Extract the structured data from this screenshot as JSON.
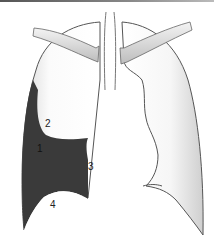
{
  "diagram": {
    "labels": [
      {
        "id": "1",
        "text": "1"
      },
      {
        "id": "2",
        "text": "2"
      },
      {
        "id": "3",
        "text": "3"
      },
      {
        "id": "4",
        "text": "4"
      }
    ],
    "colors": {
      "shaded_region": "#3a3a3a",
      "outline": "#555555",
      "lung_fill": "#f2f2f2",
      "background": "#ffffff"
    }
  }
}
